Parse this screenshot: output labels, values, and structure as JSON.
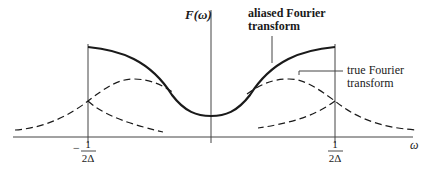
{
  "figure": {
    "y_axis_label": "F(ω)",
    "x_axis_label": "ω",
    "left_tick": {
      "sign": "−",
      "numerator": "1",
      "denominator": "2Δ"
    },
    "right_tick": {
      "numerator": "1",
      "denominator": "2Δ"
    },
    "annotations": {
      "aliased": [
        "aliased Fourier",
        "transform"
      ],
      "true": [
        "true Fourier",
        "transform"
      ]
    },
    "curves": {
      "aliased": {
        "style": "solid",
        "description": "aliased Fourier transform"
      },
      "true": {
        "style": "dashed",
        "description": "true Fourier transform"
      }
    },
    "ink_color": "#1a1a1a"
  }
}
